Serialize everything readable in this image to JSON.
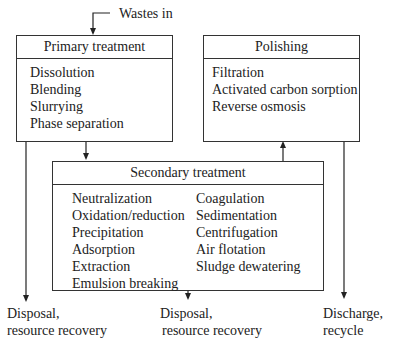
{
  "input_label": "Wastes in",
  "primary": {
    "title": "Primary treatment",
    "items": [
      "Dissolution",
      "Blending",
      "Slurrying",
      "Phase separation"
    ]
  },
  "polishing": {
    "title": "Polishing",
    "items": [
      "Filtration",
      "Activated carbon sorption",
      "Reverse osmosis"
    ]
  },
  "secondary": {
    "title": "Secondary treatment",
    "col1": [
      "Neutralization",
      "Oxidation/reduction",
      "Precipitation",
      "Adsorption",
      "Extraction",
      "Emulsion breaking"
    ],
    "col2": [
      "Coagulation",
      "Sedimentation",
      "Centrifugation",
      "Air flotation",
      "Sludge dewatering"
    ]
  },
  "outputs": {
    "left": {
      "line1": "Disposal,",
      "line2": "resource recovery"
    },
    "middle": {
      "line1": "Disposal,",
      "line2": "resource recovery"
    },
    "right": {
      "line1": "Discharge,",
      "line2": "recycle"
    }
  }
}
